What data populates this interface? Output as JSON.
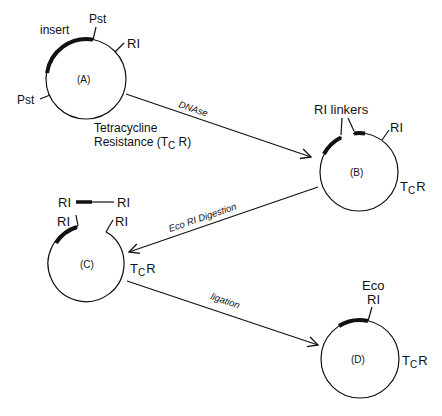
{
  "diagram": {
    "type": "plasmid-cloning-workflow",
    "plasmids": [
      {
        "id": "A",
        "label": "(A)",
        "labels": {
          "insert": "insert",
          "pst_top": "Pst",
          "pst_left": "Pst",
          "ri": "RI",
          "resistance_line1": "Tetracycline",
          "resistance_line2": "Resistance (T",
          "resistance_sub": "C",
          "resistance_end": " R)"
        }
      },
      {
        "id": "B",
        "label": "(B)",
        "labels": {
          "linkers": "RI linkers",
          "ri": "RI",
          "tcr_t": "T",
          "tcr_sub": "C",
          "tcr_r": "R"
        }
      },
      {
        "id": "C",
        "label": "(C)",
        "labels": {
          "ri_left": "RI",
          "ri_right": "RI",
          "fragment_left": "RI",
          "fragment_right": "RI",
          "tcr_t": "T",
          "tcr_sub": "C",
          "tcr_r": "R"
        }
      },
      {
        "id": "D",
        "label": "(D)",
        "labels": {
          "eco": "Eco",
          "ri": "RI",
          "tcr_t": "T",
          "tcr_sub": "C",
          "tcr_r": "R"
        }
      }
    ],
    "steps": [
      {
        "from": "A",
        "to": "B",
        "label": "DNAse"
      },
      {
        "from": "B",
        "to": "C",
        "label": "Eco RI Digestion"
      },
      {
        "from": "C",
        "to": "D",
        "label": "ligation"
      }
    ],
    "colors": {
      "line": "#111111",
      "background": "#ffffff"
    }
  }
}
